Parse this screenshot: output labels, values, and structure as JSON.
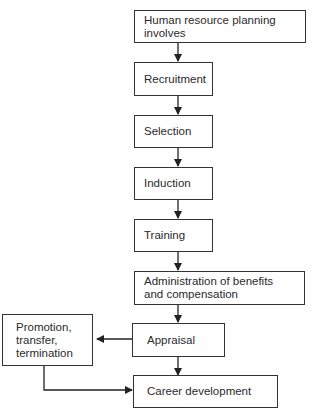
{
  "diagram": {
    "type": "flowchart",
    "nodes": [
      {
        "id": "hrp",
        "label": "Human resource planning involves"
      },
      {
        "id": "recruitment",
        "label": "Recruitment"
      },
      {
        "id": "selection",
        "label": "Selection"
      },
      {
        "id": "induction",
        "label": "Induction"
      },
      {
        "id": "training",
        "label": "Training"
      },
      {
        "id": "admin",
        "label": "Administration of benefits and compensation"
      },
      {
        "id": "appraisal",
        "label": "Appraisal"
      },
      {
        "id": "promotion",
        "label": "Promotion, transfer, termination"
      },
      {
        "id": "career",
        "label": "Career development"
      }
    ],
    "edges": [
      {
        "from": "hrp",
        "to": "recruitment"
      },
      {
        "from": "recruitment",
        "to": "selection"
      },
      {
        "from": "selection",
        "to": "induction"
      },
      {
        "from": "induction",
        "to": "training"
      },
      {
        "from": "training",
        "to": "admin"
      },
      {
        "from": "admin",
        "to": "appraisal"
      },
      {
        "from": "appraisal",
        "to": "promotion"
      },
      {
        "from": "appraisal",
        "to": "career"
      },
      {
        "from": "promotion",
        "to": "career"
      }
    ]
  }
}
